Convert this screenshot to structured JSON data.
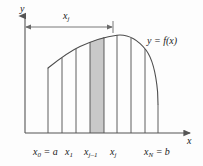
{
  "figure": {
    "type": "riemann-sum-diagram",
    "background_color": "#fdfdfd",
    "line_color": "#4d4d4d",
    "axis_color": "#555555",
    "shade_color": "#c9c9c9",
    "text_color": "#1a1a1a"
  },
  "axes": {
    "y_label": "y",
    "x_label": "x",
    "x_axis": {
      "x_start": 25,
      "x_end": 192,
      "y": 133
    },
    "y_axis": {
      "x": 25,
      "y_start": 14,
      "y_end": 133
    }
  },
  "dimension": {
    "label_base": "x",
    "label_sub": "j",
    "from_x": 25,
    "to_x": 113,
    "y": 27
  },
  "curve": {
    "label_y": "y",
    "label_eq": " = ",
    "label_f": "f",
    "label_arg": "(x)",
    "label_full": "y = f(x)",
    "points": [
      [
        48,
        68
      ],
      [
        55,
        63
      ],
      [
        62,
        58
      ],
      [
        69,
        53
      ],
      [
        76,
        49
      ],
      [
        83,
        45
      ],
      [
        90,
        42
      ],
      [
        97,
        39
      ],
      [
        104,
        37
      ],
      [
        110,
        36
      ],
      [
        117,
        35
      ],
      [
        124,
        36
      ],
      [
        131,
        38
      ],
      [
        138,
        42
      ],
      [
        145,
        49
      ],
      [
        151,
        59
      ],
      [
        155,
        72
      ],
      [
        157,
        88
      ],
      [
        158,
        105
      ],
      [
        158,
        133
      ]
    ]
  },
  "partition": {
    "lines_x": [
      48,
      62,
      76,
      90,
      104,
      117,
      131,
      145,
      158
    ],
    "lines_top_y": [
      68,
      58,
      49,
      42,
      37,
      35,
      38,
      49,
      133
    ],
    "baseline_y": 133
  },
  "shaded_strip": {
    "x_left": 90,
    "x_right": 104,
    "y_top_left": 42,
    "y_top_right": 37,
    "y_bottom": 133,
    "fill": "#c9c9c9"
  },
  "ticks": [
    {
      "name": "x0",
      "x": 48
    },
    {
      "name": "x1",
      "x": 62
    },
    {
      "name": "xjm1",
      "x": 90
    },
    {
      "name": "xj",
      "x": 104
    },
    {
      "name": "xN",
      "x": 158
    }
  ],
  "labels": {
    "x0": {
      "base": "x",
      "sub": "0",
      "rest": " = a"
    },
    "x1": {
      "base": "x",
      "sub": "1",
      "rest": ""
    },
    "xjm1": {
      "base": "x",
      "sub": "j–1",
      "rest": ""
    },
    "xj": {
      "base": "x",
      "sub": "j",
      "rest": ""
    },
    "xN": {
      "base": "x",
      "sub": "N",
      "rest": " = b"
    },
    "axis_y": "y",
    "axis_x": "x",
    "dim": {
      "base": "x",
      "sub": "j"
    },
    "func": {
      "lhs": "y = ",
      "f": "f",
      "arg": "(x)"
    }
  }
}
